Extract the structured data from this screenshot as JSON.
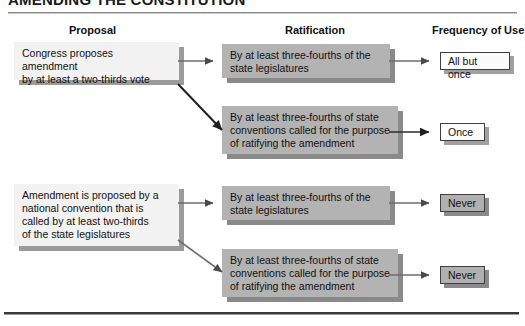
{
  "title": "AMENDING THE CONSTITUTION",
  "headers": {
    "proposal": "Proposal",
    "ratification": "Ratification",
    "frequency": "Frequency of Use"
  },
  "proposals": [
    {
      "id": "congress",
      "text": "Congress proposes amendment\nby at least a two-thirds vote"
    },
    {
      "id": "national-convention",
      "text": "Amendment is proposed by a\nnational convention that is\ncalled by at least two-thirds\nof the state legislatures"
    }
  ],
  "ratifications": [
    {
      "id": "legislatures-1",
      "text": "By at least three-fourths of the\nstate legislatures"
    },
    {
      "id": "conventions-1",
      "text": "By at least three-fourths of state\nconventions called for the purpose\nof ratifying the amendment"
    },
    {
      "id": "legislatures-2",
      "text": "By at least three-fourths of the\nstate legislatures"
    },
    {
      "id": "conventions-2",
      "text": "By at least three-fourths of state\nconventions called for the purpose\nof ratifying the amendment"
    }
  ],
  "frequencies": [
    {
      "id": "all-but-once",
      "text": "All but once",
      "style": "light"
    },
    {
      "id": "once",
      "text": "Once",
      "style": "light"
    },
    {
      "id": "never-1",
      "text": "Never",
      "style": "gray"
    },
    {
      "id": "never-2",
      "text": "Never",
      "style": "gray"
    }
  ],
  "colors": {
    "proposal_fill": "#f2f2f2",
    "ratification_fill": "#b3b3b3",
    "frequency_light_fill": "#fbfbfb",
    "frequency_gray_fill": "#b0b0b0",
    "shadow": "#8f8f8f",
    "arrow": "#4a4a4a",
    "text": "#111111"
  },
  "arrows": [
    {
      "id": "congress-to-legislatures",
      "from": "congress",
      "to": "legislatures-1"
    },
    {
      "id": "congress-to-conventions",
      "from": "congress",
      "to": "conventions-1"
    },
    {
      "id": "convention-to-legislatures",
      "from": "national-convention",
      "to": "legislatures-2"
    },
    {
      "id": "convention-to-conventions",
      "from": "national-convention",
      "to": "conventions-2"
    },
    {
      "id": "legislatures1-to-freq",
      "from": "legislatures-1",
      "to": "all-but-once"
    },
    {
      "id": "conventions1-to-freq",
      "from": "conventions-1",
      "to": "once"
    },
    {
      "id": "legislatures2-to-freq",
      "from": "legislatures-2",
      "to": "never-1"
    },
    {
      "id": "conventions2-to-freq",
      "from": "conventions-2",
      "to": "never-2"
    }
  ]
}
